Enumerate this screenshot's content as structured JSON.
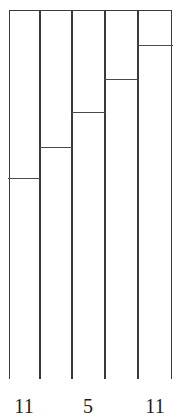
{
  "figure": {
    "background_color": "#ffffff",
    "line_color": "#3a3a3a",
    "divider_color": "#4a4a4a",
    "fill_color": "#ffffff"
  },
  "axis_labels": [
    {
      "text": "11",
      "x": 24
    },
    {
      "text": "5",
      "x": 88
    },
    {
      "text": "11",
      "x": 155
    }
  ],
  "chart_data": {
    "type": "bar",
    "title": "",
    "subtitle": "",
    "xlabel": "",
    "ylabel": "",
    "grid": false,
    "legend": "none",
    "orientation": "vertical",
    "stacked": true,
    "categories": [
      "1",
      "2",
      "3",
      "4",
      "5"
    ],
    "ylim": [
      0,
      100
    ],
    "series": [
      {
        "name": "upper-segment",
        "values": [
          45.3,
          36.9,
          27.4,
          18.4,
          9.2
        ]
      },
      {
        "name": "lower-segment",
        "values": [
          54.7,
          63.1,
          72.6,
          81.6,
          90.8
        ]
      }
    ],
    "bars": [
      {
        "index": 1,
        "x_left_px": 9,
        "x_right_px": 40,
        "top_px": 10,
        "bottom_px": 379,
        "divider_px": 177,
        "upper_fraction": 45.3,
        "lower_fraction": 54.7
      },
      {
        "index": 2,
        "x_left_px": 40,
        "x_right_px": 72,
        "top_px": 10,
        "bottom_px": 379,
        "divider_px": 146,
        "upper_fraction": 36.9,
        "lower_fraction": 63.1
      },
      {
        "index": 3,
        "x_left_px": 72,
        "x_right_px": 105,
        "top_px": 10,
        "bottom_px": 379,
        "divider_px": 111,
        "upper_fraction": 27.4,
        "lower_fraction": 72.6
      },
      {
        "index": 4,
        "x_left_px": 105,
        "x_right_px": 138,
        "top_px": 10,
        "bottom_px": 379,
        "divider_px": 78,
        "upper_fraction": 18.4,
        "lower_fraction": 81.6
      },
      {
        "index": 5,
        "x_left_px": 138,
        "x_right_px": 172,
        "top_px": 10,
        "bottom_px": 379,
        "divider_px": 44,
        "upper_fraction": 9.2,
        "lower_fraction": 90.8
      }
    ],
    "tick_labels": [
      "11",
      "5",
      "11"
    ]
  }
}
